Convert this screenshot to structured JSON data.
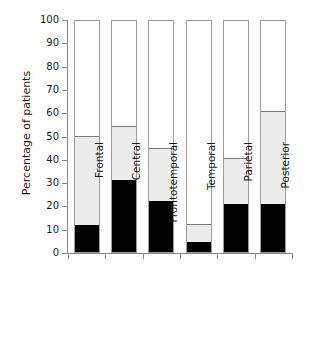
{
  "chart_data": {
    "type": "bar",
    "subtype": "stacked-bar",
    "title": "",
    "xlabel": "",
    "ylabel": "Percentage of patients",
    "categories": [
      "Frontal",
      "Central",
      "Frontotemporal",
      "Temporal",
      "Parietal",
      "Posterior"
    ],
    "ylim": [
      0,
      100
    ],
    "yticks": [
      0,
      10,
      20,
      30,
      40,
      50,
      60,
      70,
      80,
      90,
      100
    ],
    "ytick_labels": [
      "0",
      "10",
      "20",
      "30",
      "40",
      "50",
      "60",
      "70",
      "80",
      "90",
      "100"
    ],
    "grid": false,
    "legend": null,
    "series": [
      {
        "name": "black-segment",
        "color": "#000000",
        "values": [
          11.5,
          31,
          22,
          4.5,
          20.5,
          20.5
        ]
      },
      {
        "name": "gray-segment",
        "color": "#ececec",
        "values": [
          38.5,
          23,
          22.5,
          7.5,
          20,
          40
        ]
      }
    ],
    "cumulative_tops": [
      50,
      54,
      44.5,
      12,
      40.5,
      60.5
    ],
    "bar_outline_color": "#9d9d9d",
    "axis_color": "#8a8a8a",
    "text_color": "#1a1a1a",
    "background": "#ffffff"
  }
}
